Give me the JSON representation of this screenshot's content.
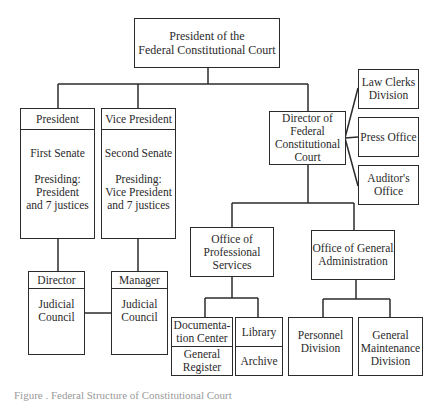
{
  "chart": {
    "type": "org-chart",
    "root": {
      "label": "President of the\nFederal Constitutional Court"
    },
    "senates": [
      {
        "header": "President",
        "body": "First Senate\n\nPresiding:\nPresident\nand 7 justices"
      },
      {
        "header": "Vice President",
        "body": "Second Senate\n\nPresiding:\nVice President\nand 7 justices"
      }
    ],
    "councils": [
      {
        "header": "Director",
        "body": "Judicial\nCouncil"
      },
      {
        "header": "Manager",
        "body": "Judicial\nCouncil"
      }
    ],
    "director": {
      "label": "Director of\nFederal\nConstitutional\nCourt"
    },
    "staff_units": [
      {
        "label": "Law Clerks\nDivision"
      },
      {
        "label": "Press Office"
      },
      {
        "label": "Auditor's\nOffice"
      }
    ],
    "offices": [
      {
        "label": "Office of\nProfessional\nServices"
      },
      {
        "label": "Office of General\nAdministration"
      }
    ],
    "professional_units": [
      {
        "top": "Documenta-\ntion Center",
        "bottom": "General\nRegister"
      },
      {
        "top": "Library",
        "bottom": "Archive"
      }
    ],
    "admin_units": [
      {
        "label": "Personnel\nDivision"
      },
      {
        "label": "General\nMaintenance\nDivision"
      }
    ]
  },
  "caption": "Figure . Federal Structure of Constitutional Court"
}
